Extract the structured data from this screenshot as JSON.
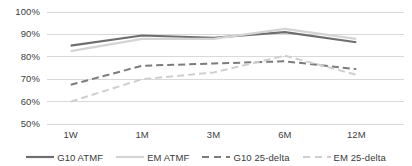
{
  "chart_data": {
    "type": "line",
    "title": "",
    "xlabel": "",
    "ylabel": "",
    "categories": [
      "1W",
      "1M",
      "3M",
      "6M",
      "12M"
    ],
    "ylim": [
      50,
      100
    ],
    "ytick_labels": [
      "100%",
      "90%",
      "80%",
      "70%",
      "60%",
      "50%"
    ],
    "ytick_values": [
      100,
      90,
      80,
      70,
      60,
      50
    ],
    "grid": true,
    "legend_position": "bottom",
    "series": [
      {
        "name": "G10 ATMF",
        "values": [
          85,
          89.5,
          88.5,
          91,
          86.5
        ],
        "color": "#6e6e6e",
        "style": "solid",
        "width": 2.2
      },
      {
        "name": "EM ATMF",
        "values": [
          82.5,
          88,
          88,
          92.5,
          88
        ],
        "color": "#d4d4d4",
        "style": "solid",
        "width": 2.2
      },
      {
        "name": "G10 25-delta",
        "values": [
          67.5,
          76,
          77,
          78,
          74.5
        ],
        "color": "#7c7c7c",
        "style": "dashed",
        "width": 2.0
      },
      {
        "name": "EM 25-delta",
        "values": [
          60,
          70,
          73,
          80.5,
          72
        ],
        "color": "#cfcfcf",
        "style": "dashed",
        "width": 2.0
      }
    ]
  },
  "axis": {
    "gridline_color": "#d9d9d9"
  }
}
